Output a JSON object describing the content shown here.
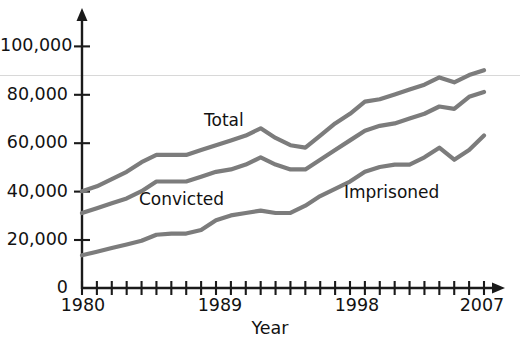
{
  "chart_data": {
    "type": "line",
    "title": "",
    "xlabel": "Year",
    "ylabel": "",
    "xlim": [
      1980,
      2007
    ],
    "ylim": [
      0,
      110000
    ],
    "grid": "single faint horizontal rule near 88,000",
    "legend_position": "inline labels on plot",
    "x_tick_labels": [
      "1980",
      "1989",
      "1998",
      "2007"
    ],
    "x_tick_values": [
      1980,
      1989,
      1998,
      2007
    ],
    "x_minor_ticks_every": 1,
    "y_tick_labels": [
      "0",
      "20,000",
      "40,000",
      "60,000",
      "80,000",
      "100,000"
    ],
    "y_tick_values": [
      0,
      20000,
      40000,
      60000,
      80000,
      100000
    ],
    "x": [
      1980,
      1981,
      1982,
      1983,
      1984,
      1985,
      1986,
      1987,
      1988,
      1989,
      1990,
      1991,
      1992,
      1993,
      1994,
      1995,
      1996,
      1997,
      1998,
      1999,
      2000,
      2001,
      2002,
      2003,
      2004,
      2005,
      2006,
      2007
    ],
    "series": [
      {
        "name": "Total",
        "label": "Total",
        "color": "#7c7c7c",
        "values": [
          40000,
          42000,
          45000,
          48000,
          52000,
          55000,
          55000,
          55000,
          57000,
          59000,
          61000,
          63000,
          66000,
          62000,
          59000,
          58000,
          63000,
          68000,
          72000,
          77000,
          78000,
          80000,
          82000,
          84000,
          87000,
          85000,
          88000,
          90000
        ]
      },
      {
        "name": "Convicted",
        "label": "Convicted",
        "color": "#7c7c7c",
        "values": [
          31000,
          33000,
          35000,
          37000,
          40000,
          44000,
          44000,
          44000,
          46000,
          48000,
          49000,
          51000,
          54000,
          51000,
          49000,
          49000,
          53000,
          57000,
          61000,
          65000,
          67000,
          68000,
          70000,
          72000,
          75000,
          74000,
          79000,
          81000
        ]
      },
      {
        "name": "Imprisoned",
        "label": "Imprisoned",
        "color": "#7c7c7c",
        "values": [
          13500,
          15000,
          16500,
          18000,
          19500,
          22000,
          22500,
          22500,
          24000,
          28000,
          30000,
          31000,
          32000,
          31000,
          31000,
          34000,
          38000,
          41000,
          44000,
          48000,
          50000,
          51000,
          51000,
          54000,
          58000,
          53000,
          57000,
          63000
        ]
      }
    ]
  },
  "labels": {
    "total": "Total",
    "convicted": "Convicted",
    "imprisoned": "Imprisoned",
    "x_axis_title": "Year"
  },
  "colors": {
    "line": "#7c7c7c",
    "axis": "#1a1a1a",
    "grid": "#d8d8d8",
    "text": "#121212",
    "background": "#ffffff"
  }
}
